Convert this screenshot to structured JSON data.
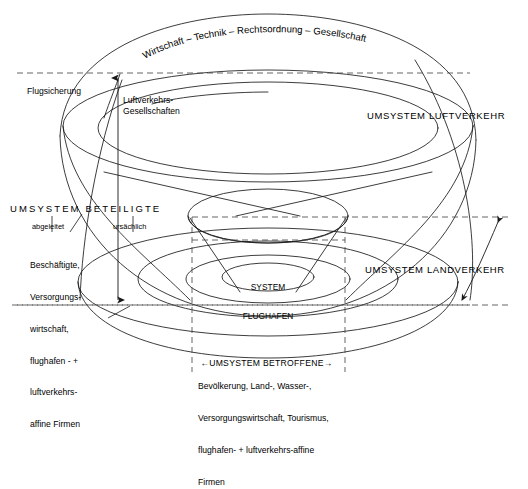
{
  "diagram": {
    "title_curved": "Wirtschaft – Technik – Rechtsordnung – Gesellschaft",
    "core": {
      "line1": "SYSTEM",
      "line2": "FLUGHAFEN"
    },
    "labels": {
      "flugsicherung": "Flugsicherung",
      "luftverkehrs_gesellschaften_l1": "Luftverkehrs-",
      "luftverkehrs_gesellschaften_l2": "Gesellschaften",
      "umsystem_luftverkehr": "UMSYSTEM LUFTVERKEHR",
      "umsystem_landverkehr": "UMSYSTEM LANDVERKEHR",
      "umsystem_beteiligte": "UMSYSTEM BETEILIGTE",
      "abgeleitet": "abgeleitet",
      "ursaechlich": "ursächlich",
      "umsystem_betroffene": "UMSYSTEM BETROFFENE",
      "arrow_left_glyph": "←",
      "arrow_right_glyph": "→"
    },
    "beteiligte_detail": [
      "Beschäftigte,",
      "Versorgungs-",
      "wirtschaft,",
      "flughafen - +",
      "luftverkehrs-",
      "affine Firmen"
    ],
    "betroffene_detail": [
      "Bevölkerung, Land-, Wasser-,",
      "Versorgungswirtschaft, Tourismus,",
      "flughafen- + luftverkehrs-affine",
      "Firmen"
    ],
    "colors": {
      "stroke": "#1a1a1a",
      "dash": "#555555",
      "background": "#ffffff"
    }
  }
}
